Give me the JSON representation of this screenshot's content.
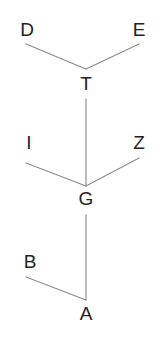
{
  "diagram": {
    "type": "tree",
    "background_color": "#ffffff",
    "line_color": "#8a8a8a",
    "label_color": "#232323",
    "width": 164,
    "height": 362,
    "nodes": [
      {
        "id": "D",
        "label": "D",
        "x": 27,
        "y": 20,
        "role": "leaf"
      },
      {
        "id": "E",
        "label": "E",
        "x": 139,
        "y": 20,
        "role": "leaf"
      },
      {
        "id": "T",
        "label": "T",
        "x": 86,
        "y": 74,
        "role": "internal"
      },
      {
        "id": "I",
        "label": "I",
        "x": 29,
        "y": 133,
        "role": "leaf"
      },
      {
        "id": "Z",
        "label": "Z",
        "x": 139,
        "y": 133,
        "role": "leaf"
      },
      {
        "id": "G",
        "label": "G",
        "x": 86,
        "y": 189,
        "role": "internal"
      },
      {
        "id": "B",
        "label": "B",
        "x": 30,
        "y": 252,
        "role": "leaf"
      },
      {
        "id": "A",
        "label": "A",
        "x": 86,
        "y": 304,
        "role": "root"
      }
    ],
    "edges": [
      {
        "id": "edge-d-t",
        "from": "D",
        "to": "T",
        "x1": 26,
        "y1": 44,
        "x2": 86,
        "y2": 69
      },
      {
        "id": "edge-e-t",
        "from": "E",
        "to": "T",
        "x1": 139,
        "y1": 44,
        "x2": 86,
        "y2": 69
      },
      {
        "id": "edge-t-g",
        "from": "T",
        "to": "G",
        "x1": 86,
        "y1": 99,
        "x2": 86,
        "y2": 186
      },
      {
        "id": "edge-i-g",
        "from": "I",
        "to": "G",
        "x1": 26,
        "y1": 163,
        "x2": 86,
        "y2": 186
      },
      {
        "id": "edge-z-g",
        "from": "Z",
        "to": "G",
        "x1": 139,
        "y1": 158,
        "x2": 86,
        "y2": 186
      },
      {
        "id": "edge-g-a",
        "from": "G",
        "to": "A",
        "x1": 86,
        "y1": 215,
        "x2": 86,
        "y2": 300
      },
      {
        "id": "edge-b-a",
        "from": "B",
        "to": "A",
        "x1": 26,
        "y1": 277,
        "x2": 86,
        "y2": 300
      }
    ]
  }
}
